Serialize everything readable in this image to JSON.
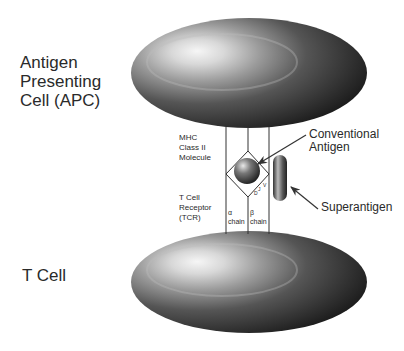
{
  "labels": {
    "apc": [
      "Antigen",
      "Presenting",
      "Cell (APC)"
    ],
    "tcell": "T Cell",
    "mhc": [
      "MHC",
      "Class II",
      "Molecule"
    ],
    "tcr": [
      "T Cell",
      "Receptor",
      "(TCR)"
    ],
    "alpha_chain": [
      "α",
      "chain"
    ],
    "beta_chain": [
      "β",
      "chain"
    ],
    "conventional_antigen": [
      "Conventional",
      "Antigen"
    ],
    "superantigen": "Superantigen",
    "beta_segments": [
      "V",
      "J",
      "D"
    ]
  },
  "colors": {
    "cell_dark": "#1e1e1e",
    "cell_mid": "#6b6b6b",
    "cell_highlight": "#f4f4f4",
    "line": "#333333"
  }
}
